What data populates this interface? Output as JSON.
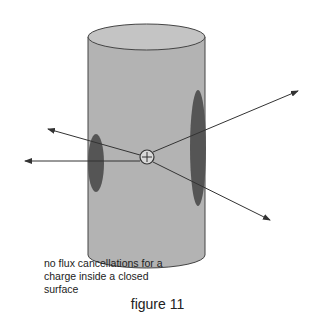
{
  "diagram": {
    "caption": "no flux cancellations for a charge inside a closed surface",
    "caption_lines": [
      "no flux cancellations for a",
      "charge inside a closed",
      "surface"
    ],
    "figure_label": "figure 11",
    "charge_symbol": "+",
    "colors": {
      "cylinder_body": "#b3b3b3",
      "cylinder_top": "#c4c4c4",
      "flux_patch": "#555555",
      "outline": "#444444"
    }
  }
}
